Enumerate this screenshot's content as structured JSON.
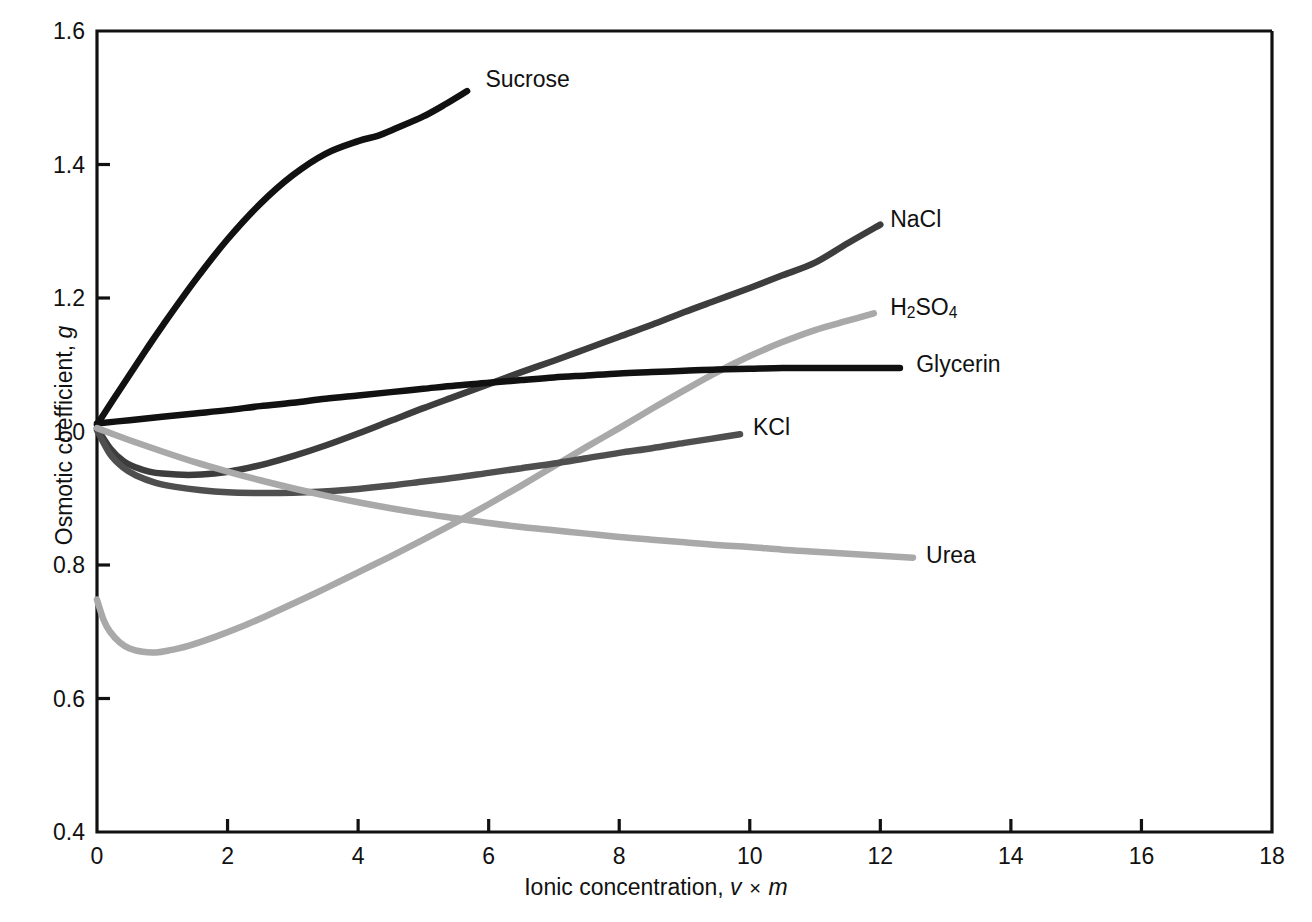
{
  "chart_data": {
    "type": "line",
    "title": "",
    "xlabel": "Ionic concentration, v × m",
    "xlabel_parts": {
      "prefix": "Ionic concentration, ",
      "var1": "v",
      "operator": "×",
      "var2": "m"
    },
    "ylabel": "Osmotic coefficient, g",
    "ylabel_parts": {
      "prefix": "Osmotic coefficient, ",
      "var": "g"
    },
    "xlim": [
      0,
      18
    ],
    "ylim": [
      0.4,
      1.6
    ],
    "xticks": [
      0,
      2,
      4,
      6,
      8,
      10,
      12,
      14,
      16,
      18
    ],
    "xtick_labels": [
      "0",
      "2",
      "4",
      "6",
      "8",
      "10",
      "12",
      "14",
      "16",
      "18"
    ],
    "yticks": [
      0.4,
      0.6,
      0.8,
      1.0,
      1.2,
      1.4,
      1.6
    ],
    "ytick_labels": [
      "0.4",
      "0.6",
      "0.8",
      "1.0",
      "1.2",
      "1.4",
      "1.6"
    ],
    "grid": false,
    "legend_position": "inline-end-of-curve",
    "series": [
      {
        "name": "Sucrose",
        "label": "Sucrose",
        "label_html": "Sucrose",
        "color": "#111111",
        "width": 6.5,
        "label_x": 5.95,
        "label_y": 1.525,
        "points": [
          [
            0.0,
            1.01
          ],
          [
            0.25,
            1.048
          ],
          [
            0.5,
            1.085
          ],
          [
            0.75,
            1.122
          ],
          [
            1.0,
            1.158
          ],
          [
            1.5,
            1.226
          ],
          [
            2.0,
            1.288
          ],
          [
            2.5,
            1.341
          ],
          [
            3.0,
            1.384
          ],
          [
            3.5,
            1.416
          ],
          [
            4.0,
            1.435
          ],
          [
            4.3,
            1.443
          ],
          [
            4.6,
            1.455
          ],
          [
            5.0,
            1.472
          ],
          [
            5.35,
            1.491
          ],
          [
            5.67,
            1.51
          ]
        ]
      },
      {
        "name": "NaCl",
        "label": "NaCl",
        "label_html": "NaCl",
        "color": "#3d3d3d",
        "width": 6.5,
        "label_x": 12.15,
        "label_y": 1.315,
        "points": [
          [
            0.0,
            1.005
          ],
          [
            0.2,
            0.975
          ],
          [
            0.4,
            0.956
          ],
          [
            0.6,
            0.946
          ],
          [
            0.8,
            0.94
          ],
          [
            1.0,
            0.937
          ],
          [
            1.4,
            0.935
          ],
          [
            1.8,
            0.937
          ],
          [
            2.2,
            0.943
          ],
          [
            2.6,
            0.952
          ],
          [
            3.0,
            0.963
          ],
          [
            3.5,
            0.979
          ],
          [
            4.0,
            0.997
          ],
          [
            4.5,
            1.016
          ],
          [
            5.0,
            1.035
          ],
          [
            5.5,
            1.053
          ],
          [
            6.0,
            1.071
          ],
          [
            6.5,
            1.089
          ],
          [
            7.0,
            1.106
          ],
          [
            7.5,
            1.124
          ],
          [
            8.0,
            1.142
          ],
          [
            8.5,
            1.16
          ],
          [
            9.0,
            1.179
          ],
          [
            9.5,
            1.197
          ],
          [
            10.0,
            1.215
          ],
          [
            10.5,
            1.234
          ],
          [
            11.0,
            1.253
          ],
          [
            11.5,
            1.282
          ],
          [
            12.0,
            1.31
          ]
        ]
      },
      {
        "name": "H2SO4",
        "label": "H2SO4",
        "label_html": "H<sub>2</sub>SO<sub>4</sub>",
        "color": "#a9a9a9",
        "width": 6.5,
        "label_x": 12.15,
        "label_y": 1.183,
        "points": [
          [
            0.0,
            0.748
          ],
          [
            0.1,
            0.718
          ],
          [
            0.2,
            0.7
          ],
          [
            0.35,
            0.684
          ],
          [
            0.5,
            0.675
          ],
          [
            0.7,
            0.67
          ],
          [
            0.9,
            0.669
          ],
          [
            1.1,
            0.672
          ],
          [
            1.4,
            0.679
          ],
          [
            1.8,
            0.692
          ],
          [
            2.2,
            0.707
          ],
          [
            2.6,
            0.724
          ],
          [
            3.0,
            0.742
          ],
          [
            3.5,
            0.765
          ],
          [
            4.0,
            0.789
          ],
          [
            4.5,
            0.813
          ],
          [
            5.0,
            0.838
          ],
          [
            5.5,
            0.864
          ],
          [
            6.0,
            0.891
          ],
          [
            6.5,
            0.919
          ],
          [
            7.0,
            0.948
          ],
          [
            7.5,
            0.977
          ],
          [
            8.0,
            1.005
          ],
          [
            8.5,
            1.034
          ],
          [
            9.0,
            1.062
          ],
          [
            9.5,
            1.089
          ],
          [
            10.0,
            1.113
          ],
          [
            10.5,
            1.134
          ],
          [
            11.0,
            1.152
          ],
          [
            11.5,
            1.166
          ],
          [
            11.9,
            1.177
          ]
        ]
      },
      {
        "name": "Glycerin",
        "label": "Glycerin",
        "label_html": "Glycerin",
        "color": "#111111",
        "width": 6.5,
        "label_x": 12.55,
        "label_y": 1.098,
        "points": [
          [
            0.0,
            1.012
          ],
          [
            0.5,
            1.017
          ],
          [
            1.0,
            1.022
          ],
          [
            1.5,
            1.027
          ],
          [
            2.0,
            1.032
          ],
          [
            2.5,
            1.038
          ],
          [
            3.0,
            1.043
          ],
          [
            3.5,
            1.049
          ],
          [
            4.0,
            1.054
          ],
          [
            4.5,
            1.059
          ],
          [
            5.0,
            1.064
          ],
          [
            5.5,
            1.069
          ],
          [
            6.0,
            1.073
          ],
          [
            6.5,
            1.077
          ],
          [
            7.0,
            1.081
          ],
          [
            7.5,
            1.084
          ],
          [
            8.0,
            1.087
          ],
          [
            8.5,
            1.089
          ],
          [
            9.0,
            1.091
          ],
          [
            9.5,
            1.093
          ],
          [
            10.0,
            1.094
          ],
          [
            10.5,
            1.095
          ],
          [
            11.0,
            1.095
          ],
          [
            11.5,
            1.095
          ],
          [
            12.3,
            1.095
          ]
        ]
      },
      {
        "name": "KCl",
        "label": "KCl",
        "label_html": "KCl",
        "color": "#4f4f4f",
        "width": 6.5,
        "label_x": 10.05,
        "label_y": 1.003,
        "points": [
          [
            0.0,
            1.002
          ],
          [
            0.2,
            0.966
          ],
          [
            0.4,
            0.946
          ],
          [
            0.6,
            0.934
          ],
          [
            0.9,
            0.923
          ],
          [
            1.2,
            0.917
          ],
          [
            1.6,
            0.912
          ],
          [
            2.0,
            0.909
          ],
          [
            2.4,
            0.908
          ],
          [
            2.8,
            0.908
          ],
          [
            3.2,
            0.909
          ],
          [
            3.6,
            0.911
          ],
          [
            4.0,
            0.914
          ],
          [
            4.5,
            0.919
          ],
          [
            5.0,
            0.925
          ],
          [
            5.5,
            0.931
          ],
          [
            6.0,
            0.938
          ],
          [
            6.5,
            0.945
          ],
          [
            7.0,
            0.952
          ],
          [
            7.5,
            0.96
          ],
          [
            8.0,
            0.968
          ],
          [
            8.5,
            0.975
          ],
          [
            9.0,
            0.983
          ],
          [
            9.4,
            0.989
          ],
          [
            9.85,
            0.996
          ]
        ]
      },
      {
        "name": "Urea",
        "label": "Urea",
        "label_html": "Urea",
        "color": "#a9a9a9",
        "width": 6.5,
        "label_x": 12.7,
        "label_y": 0.812,
        "points": [
          [
            0.0,
            1.005
          ],
          [
            0.5,
            0.987
          ],
          [
            1.0,
            0.97
          ],
          [
            1.5,
            0.954
          ],
          [
            2.0,
            0.94
          ],
          [
            2.5,
            0.927
          ],
          [
            3.0,
            0.915
          ],
          [
            3.5,
            0.904
          ],
          [
            4.0,
            0.894
          ],
          [
            4.5,
            0.885
          ],
          [
            5.0,
            0.877
          ],
          [
            5.5,
            0.87
          ],
          [
            6.0,
            0.863
          ],
          [
            6.5,
            0.857
          ],
          [
            7.0,
            0.852
          ],
          [
            7.5,
            0.847
          ],
          [
            8.0,
            0.842
          ],
          [
            8.5,
            0.838
          ],
          [
            9.0,
            0.834
          ],
          [
            9.5,
            0.83
          ],
          [
            10.0,
            0.827
          ],
          [
            10.5,
            0.823
          ],
          [
            11.0,
            0.82
          ],
          [
            11.5,
            0.817
          ],
          [
            12.0,
            0.814
          ],
          [
            12.5,
            0.811
          ]
        ]
      }
    ]
  }
}
